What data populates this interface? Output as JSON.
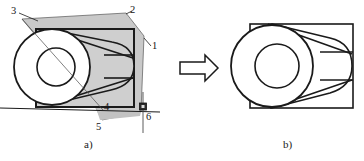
{
  "figure": {
    "title": "",
    "parts": [
      {
        "id": "a",
        "caption": "a)",
        "caption_x": 84,
        "caption_y": 141
      },
      {
        "id": "b",
        "caption": "b)",
        "caption_x": 283,
        "caption_y": 141
      }
    ],
    "transform_arrow": {
      "name": "right-arrow",
      "direction": "right"
    }
  },
  "colors": {
    "stroke": "#1a1a1a",
    "gray_fill": "#c9c9c9",
    "gray_fill_light": "#d2d2d2",
    "thin_stroke": "#3a3a3a",
    "white": "#ffffff",
    "support_marker": "#2b2b2b",
    "background": "#ffffff"
  },
  "part_a": {
    "name": "roll-in-inclined-frame-view",
    "callouts": [
      {
        "label": "3",
        "x": 11,
        "y": 8,
        "anchor": "top-left-plate-corner"
      },
      {
        "label": "2",
        "x": 128,
        "y": 8,
        "anchor": "top-right-plate-corner"
      },
      {
        "label": "1",
        "x": 152,
        "y": 42,
        "anchor": "right-plate-edge"
      },
      {
        "label": "4",
        "x": 104,
        "y": 103,
        "anchor": "inner-rectangle-bottom"
      },
      {
        "label": "5",
        "x": 96,
        "y": 123,
        "anchor": "bottom-left-plate-corner"
      },
      {
        "label": "6",
        "x": 146,
        "y": 113,
        "anchor": "support-ground-point"
      }
    ],
    "elements": [
      "gray-plate-polygon",
      "inner-rectangle",
      "outer-circle",
      "inner-circle",
      "cylinder-body-ellipse",
      "tangent-line-upper",
      "tangent-line-lower",
      "ground-line",
      "vertical-axis-line",
      "support-marker-square"
    ]
  },
  "part_b": {
    "name": "roll-in-frame-simplified-view",
    "elements": [
      "rectangle-frame",
      "outer-circle",
      "inner-circle",
      "cylinder-body-ellipse",
      "tangent-line-upper",
      "tangent-line-lower",
      "horizontal-mid-lines"
    ]
  }
}
